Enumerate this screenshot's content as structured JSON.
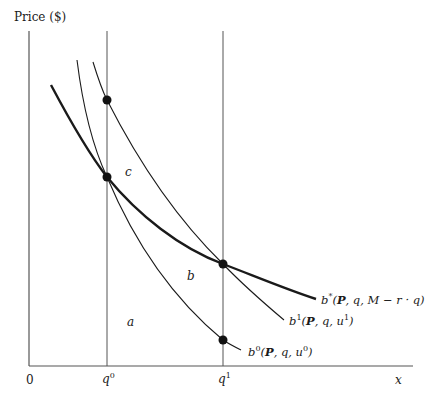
{
  "diagram": {
    "y_axis_label": "Price ($)",
    "x_axis_label": "x",
    "origin_label": "0",
    "ticks": [
      {
        "base": "q",
        "sup": "0"
      },
      {
        "base": "q",
        "sup": "1"
      }
    ],
    "regions": {
      "a": "a",
      "b": "b",
      "c": "c"
    },
    "curves": [
      {
        "id": "b-star",
        "name": "b*",
        "base": "b",
        "sup": "*",
        "args_bold": "P",
        "args_rest": ", q, M − r · q)",
        "weight": "thick"
      },
      {
        "id": "b-one",
        "name": "b1",
        "base": "b",
        "sup": "1",
        "args_bold": "P",
        "args_rest": ", q, u",
        "args_sup": "1",
        "args_close": ")",
        "weight": "thin"
      },
      {
        "id": "b-zero",
        "name": "b0",
        "base": "b",
        "sup": "0",
        "args_bold": "P",
        "args_rest": ", q, u",
        "args_sup": "0",
        "args_close": ")",
        "weight": "thin"
      }
    ],
    "points": [
      {
        "at": "q0",
        "on": "b1",
        "x": 107,
        "y": 100
      },
      {
        "at": "q0",
        "on": "b*/b0",
        "x": 107,
        "y": 177
      },
      {
        "at": "q1",
        "on": "b*/b1",
        "x": 223,
        "y": 264
      },
      {
        "at": "q1",
        "on": "b0",
        "x": 223,
        "y": 340
      }
    ],
    "colors": {
      "ink": "#1a1a1a",
      "axis": "#555555",
      "background": "#ffffff"
    }
  }
}
